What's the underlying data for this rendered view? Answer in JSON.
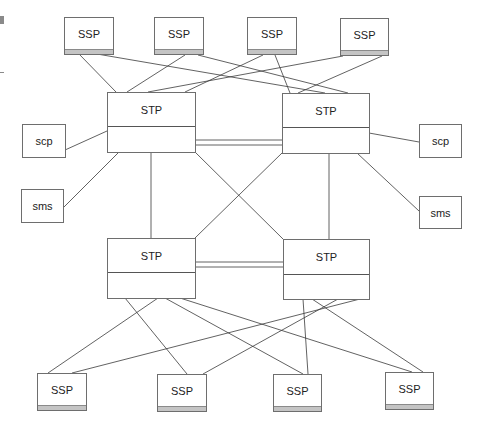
{
  "diagram": {
    "title": "",
    "colors": {
      "line": "#3a3a3a",
      "box_border": "#6e6e6e",
      "ssp_bar": "#c4c4c4"
    },
    "nodes": {
      "ssp_top_1": {
        "label": "SSP"
      },
      "ssp_top_2": {
        "label": "SSP"
      },
      "ssp_top_3": {
        "label": "SSP"
      },
      "ssp_top_4": {
        "label": "SSP"
      },
      "stp_top_left": {
        "label": "STP"
      },
      "stp_top_right": {
        "label": "STP"
      },
      "stp_bottom_left": {
        "label": "STP"
      },
      "stp_bottom_right": {
        "label": "STP"
      },
      "scp_left": {
        "label": "scp"
      },
      "sms_left": {
        "label": "sms"
      },
      "scp_right": {
        "label": "scp"
      },
      "sms_right": {
        "label": "sms"
      },
      "ssp_bottom_1": {
        "label": "SSP"
      },
      "ssp_bottom_2": {
        "label": "SSP"
      },
      "ssp_bottom_3": {
        "label": "SSP"
      },
      "ssp_bottom_4": {
        "label": "SSP"
      }
    },
    "edges": [
      [
        "ssp_top_1",
        "stp_top_left"
      ],
      [
        "ssp_top_1",
        "stp_top_right"
      ],
      [
        "ssp_top_2",
        "stp_top_left"
      ],
      [
        "ssp_top_2",
        "stp_top_right"
      ],
      [
        "ssp_top_3",
        "stp_top_left"
      ],
      [
        "ssp_top_3",
        "stp_top_right"
      ],
      [
        "ssp_top_4",
        "stp_top_left"
      ],
      [
        "ssp_top_4",
        "stp_top_right"
      ],
      [
        "stp_top_left",
        "stp_top_right",
        "double"
      ],
      [
        "stp_bottom_left",
        "stp_bottom_right",
        "double"
      ],
      [
        "stp_top_left",
        "stp_bottom_left"
      ],
      [
        "stp_top_left",
        "stp_bottom_right"
      ],
      [
        "stp_top_right",
        "stp_bottom_left"
      ],
      [
        "stp_top_right",
        "stp_bottom_right"
      ],
      [
        "scp_left",
        "stp_top_left"
      ],
      [
        "sms_left",
        "stp_top_left"
      ],
      [
        "scp_right",
        "stp_top_right"
      ],
      [
        "sms_right",
        "stp_top_right"
      ],
      [
        "stp_bottom_left",
        "ssp_bottom_1"
      ],
      [
        "stp_bottom_left",
        "ssp_bottom_2"
      ],
      [
        "stp_bottom_left",
        "ssp_bottom_3"
      ],
      [
        "stp_bottom_left",
        "ssp_bottom_4"
      ],
      [
        "stp_bottom_right",
        "ssp_bottom_1"
      ],
      [
        "stp_bottom_right",
        "ssp_bottom_2"
      ],
      [
        "stp_bottom_right",
        "ssp_bottom_3"
      ],
      [
        "stp_bottom_right",
        "ssp_bottom_4"
      ]
    ]
  }
}
